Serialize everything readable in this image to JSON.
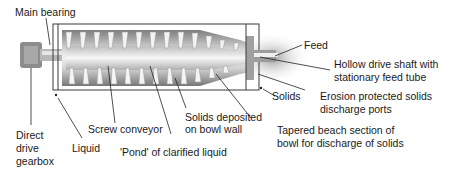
{
  "diagram": {
    "labels": {
      "main_bearing": "Main bearing",
      "feed": "Feed",
      "hollow_shaft_1": "Hollow drive shaft with",
      "hollow_shaft_2": "stationary feed tube",
      "solids": "Solids",
      "erosion_1": "Erosion protected solids",
      "erosion_2": "discharge ports",
      "direct_1": "Direct",
      "direct_2": "drive",
      "direct_3": "gearbox",
      "liquid": "Liquid",
      "screw_conveyor": "Screw conveyor",
      "solids_dep_1": "Solids deposited",
      "solids_dep_2": "on bowl wall",
      "pond": "'Pond' of clarified liquid",
      "tapered_1": "Tapered beach section of",
      "tapered_2": "bowl for discharge of solids"
    },
    "colors": {
      "text": "#1a1a1a",
      "line": "#222222",
      "body_dark": "#8a8a8a",
      "body_light": "#e6e6e6"
    }
  }
}
